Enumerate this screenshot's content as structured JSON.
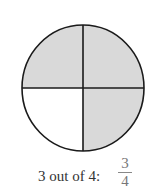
{
  "figure": {
    "total_parts": 4,
    "shaded_parts": 3,
    "shaded_quadrants": [
      "top-left",
      "top-right",
      "bottom-right"
    ],
    "unshaded_quadrants": [
      "bottom-left"
    ],
    "shade_color": "#d9d9d9",
    "line_color": "#1a1a1a"
  },
  "caption": {
    "text": "3 out of 4:",
    "numerator": "3",
    "denominator": "4"
  }
}
